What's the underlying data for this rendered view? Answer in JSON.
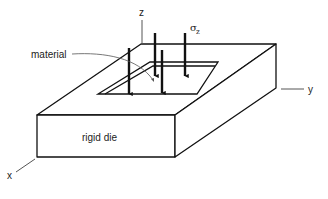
{
  "diagram": {
    "type": "isometric schematic",
    "labels": {
      "z_axis": "z",
      "y_axis": "y",
      "x_axis": "x",
      "stress_symbol": "σ",
      "stress_subscript": "z",
      "material": "material",
      "die": "rigid die"
    },
    "elements": {
      "block": "rigid die (rectangular block with rectangular cavity on top)",
      "cavity": "material placed in cavity",
      "arrows": {
        "count": 4,
        "direction": "down",
        "meaning": "applied stress σz"
      }
    },
    "colors": {
      "stroke": "#111111",
      "axis_stroke": "#555555",
      "background": "#ffffff"
    }
  }
}
